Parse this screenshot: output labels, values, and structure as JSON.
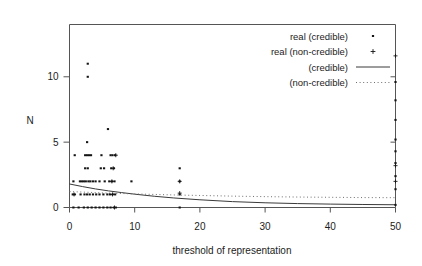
{
  "figure": {
    "background_color": "#ffffff",
    "ink_color": "#1a1a1a"
  },
  "chart_data": {
    "type": "scatter",
    "title": "",
    "xlabel": "threshold of representation",
    "ylabel": "N",
    "xlim": [
      0,
      50
    ],
    "ylim": [
      0,
      14
    ],
    "grid": false,
    "legend_position": "top-right",
    "xticks": [
      0,
      10,
      20,
      30,
      40,
      50
    ],
    "xtick_labels": [
      "0",
      "10",
      "20",
      "30",
      "40",
      "50"
    ],
    "yticks": [
      0,
      5,
      10
    ],
    "ytick_labels": [
      "0",
      "5",
      "10"
    ],
    "legend": [
      {
        "label": "real (credible)",
        "marker": "dot"
      },
      {
        "label": "real (non-credible)",
        "marker": "plus"
      },
      {
        "label": "(credible)",
        "marker": "solid-line"
      },
      {
        "label": "(non-credible)",
        "marker": "dotted-line"
      }
    ],
    "series": [
      {
        "name": "real (credible)",
        "marker": "dot",
        "points": [
          [
            2.8,
            11.0
          ],
          [
            2.8,
            10.0
          ],
          [
            5.9,
            6.0
          ],
          [
            2.7,
            5.0
          ],
          [
            0.8,
            4.0
          ],
          [
            2.4,
            4.0
          ],
          [
            2.7,
            4.0
          ],
          [
            3.0,
            4.0
          ],
          [
            3.3,
            4.0
          ],
          [
            4.9,
            4.0
          ],
          [
            6.3,
            4.0
          ],
          [
            6.6,
            4.0
          ],
          [
            7.0,
            4.0
          ],
          [
            2.4,
            3.0
          ],
          [
            2.8,
            3.0
          ],
          [
            4.8,
            3.0
          ],
          [
            5.3,
            3.0
          ],
          [
            6.4,
            3.0
          ],
          [
            6.8,
            3.0
          ],
          [
            16.9,
            3.0
          ],
          [
            0.6,
            2.0
          ],
          [
            1.6,
            2.0
          ],
          [
            1.9,
            2.0
          ],
          [
            2.2,
            2.0
          ],
          [
            2.5,
            2.0
          ],
          [
            2.9,
            2.0
          ],
          [
            3.2,
            2.0
          ],
          [
            3.6,
            2.0
          ],
          [
            4.0,
            2.0
          ],
          [
            4.6,
            2.0
          ],
          [
            5.4,
            2.0
          ],
          [
            6.1,
            2.0
          ],
          [
            6.5,
            2.0
          ],
          [
            6.9,
            2.0
          ],
          [
            9.5,
            2.0
          ],
          [
            16.9,
            2.0
          ],
          [
            0.5,
            1.0
          ],
          [
            0.8,
            1.0
          ],
          [
            1.7,
            1.0
          ],
          [
            2.3,
            1.0
          ],
          [
            2.7,
            1.0
          ],
          [
            3.1,
            1.0
          ],
          [
            3.6,
            1.0
          ],
          [
            4.1,
            1.0
          ],
          [
            4.6,
            1.0
          ],
          [
            5.2,
            1.0
          ],
          [
            5.8,
            1.0
          ],
          [
            6.2,
            1.0
          ],
          [
            6.6,
            1.0
          ],
          [
            7.0,
            1.0
          ],
          [
            16.9,
            1.0
          ],
          [
            0.6,
            0.0
          ],
          [
            1.4,
            0.0
          ],
          [
            2.2,
            0.0
          ],
          [
            2.8,
            0.0
          ],
          [
            3.4,
            0.0
          ],
          [
            4.0,
            0.0
          ],
          [
            4.6,
            0.0
          ],
          [
            5.2,
            0.0
          ],
          [
            5.8,
            0.0
          ],
          [
            6.3,
            0.0
          ],
          [
            6.8,
            0.0
          ],
          [
            7.1,
            0.0
          ],
          [
            16.9,
            0.0
          ],
          [
            50.0,
            9.6
          ],
          [
            50.0,
            8.2
          ],
          [
            50.0,
            6.7
          ],
          [
            50.0,
            5.2
          ],
          [
            50.0,
            4.3
          ],
          [
            50.0,
            3.4
          ],
          [
            50.0,
            2.4
          ],
          [
            50.0,
            1.4
          ],
          [
            50.0,
            0.2
          ]
        ]
      },
      {
        "name": "real (non-credible)",
        "marker": "plus",
        "points": [
          [
            7.1,
            4.0
          ],
          [
            6.7,
            3.0
          ],
          [
            6.5,
            2.0
          ],
          [
            16.9,
            2.0
          ],
          [
            0.7,
            1.0
          ],
          [
            6.6,
            1.0
          ],
          [
            16.9,
            1.1
          ],
          [
            6.9,
            0.0
          ],
          [
            50.0,
            11.6
          ],
          [
            50.0,
            3.2
          ],
          [
            50.0,
            2.0
          ]
        ]
      }
    ],
    "fits": [
      {
        "name": "(credible)",
        "style": "solid",
        "model": "exponential decay",
        "x": [
          0,
          2,
          4,
          6,
          8,
          10,
          13,
          16,
          20,
          25,
          30,
          35,
          40,
          45,
          50
        ],
        "y": [
          1.8,
          1.6,
          1.42,
          1.27,
          1.14,
          1.02,
          0.86,
          0.73,
          0.59,
          0.45,
          0.36,
          0.3,
          0.26,
          0.23,
          0.21
        ]
      },
      {
        "name": "(non-credible)",
        "style": "dotted",
        "model": "slow decay",
        "x": [
          0,
          2,
          4,
          6,
          8,
          10,
          13,
          16,
          20,
          25,
          30,
          35,
          40,
          45,
          50
        ],
        "y": [
          1.22,
          1.18,
          1.14,
          1.1,
          1.07,
          1.04,
          1.0,
          0.96,
          0.92,
          0.87,
          0.83,
          0.8,
          0.78,
          0.76,
          0.75
        ]
      }
    ]
  }
}
